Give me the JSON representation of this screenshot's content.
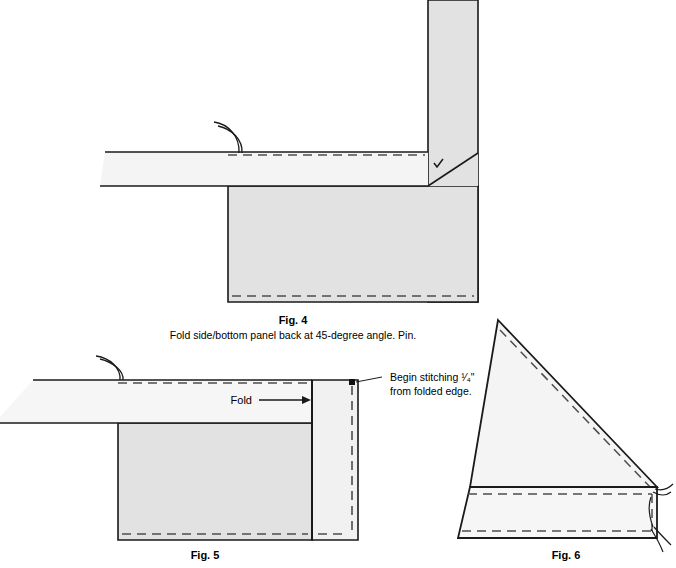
{
  "page": {
    "background": "#ffffff",
    "kind": "sewing-instruction-illustrations"
  },
  "palette": {
    "panel_fill": "#e2e2e2",
    "panel_fill_light": "#efefef",
    "panel_fill_lighter": "#f4f4f4",
    "outline": "#1a1a1a",
    "stitch_dash": "#4d4d4d",
    "text": "#000000"
  },
  "figures": [
    {
      "id": "fig4",
      "label": "Fig. 4",
      "caption": "Fold side/bottom panel back at 45-degree angle. Pin.",
      "elements": {
        "pin_marker": "pin-curve",
        "check_marker": "check-mark",
        "fold_angle": "45-degree"
      }
    },
    {
      "id": "fig5",
      "label": "Fig. 5",
      "caption": "",
      "annotations": {
        "fold_label": "Fold",
        "stitch_note_line1": "Begin stitching ¹⁄₄\"",
        "stitch_note_line2": "from folded edge."
      },
      "elements": {
        "pin_marker": "pin-curve",
        "start_dot": "stitch-start-square"
      }
    },
    {
      "id": "fig6",
      "label": "Fig. 6",
      "caption": "",
      "elements": {
        "thread_tails": "thread-tails"
      }
    }
  ]
}
